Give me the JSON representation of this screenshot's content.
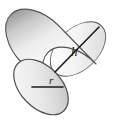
{
  "figure": {
    "shape_name": "cylinder",
    "background_color": "#ffffff",
    "outline_color": "#4a4a4a",
    "labels": {
      "height": "h",
      "radius": "r"
    }
  },
  "geometry": {
    "front_face": {
      "name": "circular-base",
      "center_x": 41,
      "center_y": 87,
      "radius_x": 33,
      "radius_y": 33,
      "rotation_deg": -44
    },
    "back_face": {
      "name": "circular-top",
      "center_x": 78,
      "center_y": 49,
      "radius_x": 33,
      "radius_y": 33,
      "rotation_deg": -44
    },
    "height_line": {
      "name": "height-dimension-line",
      "x1": 55,
      "y1": 72,
      "x2": 99,
      "y2": 27
    },
    "radius_line": {
      "name": "radius-dimension-line",
      "x1": 32,
      "y1": 87,
      "x2": 63,
      "y2": 87
    },
    "height_label_pos": {
      "x": 71,
      "y": 55
    },
    "radius_label_pos": {
      "x": 49,
      "y": 84
    }
  },
  "colors": {
    "body_light": "#f2f2f2",
    "body_mid": "#d8d8d8",
    "body_dark": "#a8a8a8",
    "face_light": "#f4f4f4",
    "face_mid": "#e2e2e2",
    "face_dark": "#bfbfbf",
    "stroke": "#4f4f4f",
    "label_color": "#1a1a1a"
  }
}
